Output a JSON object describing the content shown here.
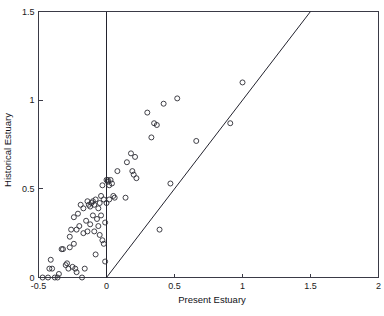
{
  "chart_data": {
    "type": "scatter",
    "title": "",
    "xlabel": "Present Estuary",
    "ylabel": "Historical Estuary",
    "xlim": [
      -0.5,
      2.0
    ],
    "ylim": [
      0.0,
      1.5
    ],
    "xticks": [
      -0.5,
      0,
      0.5,
      1,
      1.5,
      2
    ],
    "xticklabels": [
      "-0.5",
      "0",
      "0.5",
      "1",
      "1.5",
      "2"
    ],
    "yticks": [
      0,
      0.5,
      1,
      1.5
    ],
    "yticklabels": [
      "0",
      "0.5",
      "1",
      "1.5"
    ],
    "grid": false,
    "legend": null,
    "marker": "open-circle",
    "marker_color": "#2b2b33",
    "annotations": [
      {
        "type": "line",
        "name": "one-to-one-reference-line",
        "from": [
          0,
          0
        ],
        "to": [
          1.5,
          1.5
        ],
        "color": "#23232e"
      },
      {
        "type": "line",
        "name": "vertical-zero-line",
        "from": [
          0,
          0
        ],
        "to": [
          0,
          1.5
        ],
        "color": "#23232e"
      }
    ],
    "series": [
      {
        "name": "estuary-sites",
        "points": [
          [
            -0.47,
            0.0
          ],
          [
            -0.43,
            0.0
          ],
          [
            -0.42,
            0.05
          ],
          [
            -0.4,
            0.05
          ],
          [
            -0.41,
            0.1
          ],
          [
            -0.38,
            0.0
          ],
          [
            -0.36,
            0.0
          ],
          [
            -0.35,
            0.02
          ],
          [
            -0.33,
            0.16
          ],
          [
            -0.32,
            0.16
          ],
          [
            -0.3,
            0.07
          ],
          [
            -0.29,
            0.08
          ],
          [
            -0.28,
            0.05
          ],
          [
            -0.27,
            0.23
          ],
          [
            -0.27,
            0.17
          ],
          [
            -0.26,
            0.27
          ],
          [
            -0.25,
            0.06
          ],
          [
            -0.24,
            0.34
          ],
          [
            -0.24,
            0.19
          ],
          [
            -0.23,
            0.05
          ],
          [
            -0.22,
            0.27
          ],
          [
            -0.22,
            0.03
          ],
          [
            -0.21,
            0.36
          ],
          [
            -0.2,
            0.29
          ],
          [
            -0.19,
            0.41
          ],
          [
            -0.18,
            0.0
          ],
          [
            -0.17,
            0.25
          ],
          [
            -0.17,
            0.39
          ],
          [
            -0.16,
            0.05
          ],
          [
            -0.15,
            0.32
          ],
          [
            -0.14,
            0.43
          ],
          [
            -0.14,
            0.26
          ],
          [
            -0.13,
            0.41
          ],
          [
            -0.12,
            0.4
          ],
          [
            -0.12,
            0.3
          ],
          [
            -0.11,
            0.42
          ],
          [
            -0.1,
            0.43
          ],
          [
            -0.1,
            0.35
          ],
          [
            -0.09,
            0.41
          ],
          [
            -0.09,
            0.26
          ],
          [
            -0.08,
            0.44
          ],
          [
            -0.08,
            0.13
          ],
          [
            -0.07,
            0.33
          ],
          [
            -0.06,
            0.39
          ],
          [
            -0.06,
            0.29
          ],
          [
            -0.05,
            0.42
          ],
          [
            -0.05,
            0.24
          ],
          [
            -0.04,
            0.46
          ],
          [
            -0.04,
            0.35
          ],
          [
            -0.03,
            0.52
          ],
          [
            -0.03,
            0.21
          ],
          [
            -0.02,
            0.44
          ],
          [
            -0.02,
            0.19
          ],
          [
            -0.01,
            0.31
          ],
          [
            -0.01,
            0.09
          ],
          [
            0.0,
            0.42
          ],
          [
            0.0,
            0.55
          ],
          [
            0.01,
            0.54
          ],
          [
            0.01,
            0.55
          ],
          [
            0.02,
            0.52
          ],
          [
            0.02,
            0.44
          ],
          [
            0.03,
            0.55
          ],
          [
            0.04,
            0.53
          ],
          [
            0.05,
            0.46
          ],
          [
            0.06,
            0.45
          ],
          [
            0.08,
            0.6
          ],
          [
            0.14,
            0.45
          ],
          [
            0.15,
            0.65
          ],
          [
            0.18,
            0.7
          ],
          [
            0.19,
            0.6
          ],
          [
            0.2,
            0.58
          ],
          [
            0.21,
            0.68
          ],
          [
            0.22,
            0.56
          ],
          [
            0.3,
            0.93
          ],
          [
            0.33,
            0.79
          ],
          [
            0.35,
            0.87
          ],
          [
            0.37,
            0.86
          ],
          [
            0.39,
            0.27
          ],
          [
            0.42,
            0.98
          ],
          [
            0.47,
            0.53
          ],
          [
            0.52,
            1.01
          ],
          [
            0.66,
            0.77
          ],
          [
            0.91,
            0.87
          ],
          [
            1.0,
            1.1
          ]
        ]
      }
    ]
  },
  "axes": {
    "x_title": "Present Estuary",
    "y_title": "Historical Estuary"
  }
}
